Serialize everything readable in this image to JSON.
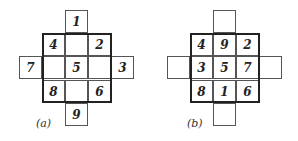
{
  "figures": [
    {
      "label": "(a)",
      "cells": {
        "top": "1",
        "left": "7",
        "right": "3",
        "bottom": "9",
        "r0c0": "4",
        "r0c1": "",
        "r0c2": "2",
        "r1c0": "",
        "r1c1": "5",
        "r1c2": "",
        "r2c0": "8",
        "r2c1": "",
        "r2c2": "6"
      }
    },
    {
      "label": "(b)",
      "cells": {
        "top": "",
        "left": "",
        "right": "",
        "bottom": "",
        "r0c0": "4",
        "r0c1": "9",
        "r0c2": "2",
        "r1c0": "3",
        "r1c1": "5",
        "r1c2": "7",
        "r2c0": "8",
        "r2c1": "1",
        "r2c2": "6"
      }
    }
  ]
}
